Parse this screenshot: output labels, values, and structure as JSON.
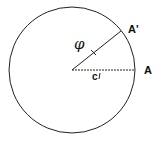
{
  "diagram": {
    "labels": {
      "point_a": "A",
      "point_a_prime": "A'",
      "angle": "φ",
      "center_label": "c"
    },
    "colors": {
      "stroke": "#222222",
      "background": "#ffffff"
    }
  }
}
